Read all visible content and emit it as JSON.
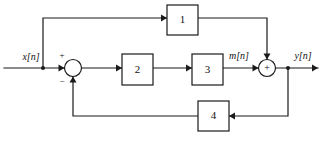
{
  "diagram": {
    "stroke_color": "#1a1a1a",
    "background_color": "#ffffff",
    "blocks": [
      {
        "id": "block-1",
        "label": "1",
        "x": 167,
        "y": 5,
        "w": 31,
        "h": 30
      },
      {
        "id": "block-2",
        "label": "2",
        "x": 122,
        "y": 54,
        "w": 31,
        "h": 31
      },
      {
        "id": "block-3",
        "label": "3",
        "x": 192,
        "y": 54,
        "w": 31,
        "h": 31
      },
      {
        "id": "block-4",
        "label": "4",
        "x": 198,
        "y": 101,
        "w": 31,
        "h": 30
      }
    ],
    "summers": [
      {
        "id": "summer-input",
        "cx": 73,
        "cy": 68,
        "r": 8.5,
        "symbol": ""
      },
      {
        "id": "summer-output",
        "cx": 267,
        "cy": 68,
        "r": 8.5,
        "symbol": "+"
      }
    ],
    "signs": [
      {
        "id": "sign-plus-input",
        "label": "+",
        "x": 62,
        "y": 55
      },
      {
        "id": "sign-minus-input",
        "label": "−",
        "x": 62,
        "y": 82
      }
    ],
    "signals": [
      {
        "id": "signal-x",
        "label": "x[n]",
        "x": 31,
        "y": 58
      },
      {
        "id": "signal-m",
        "label": "m[n]",
        "x": 239,
        "y": 57
      },
      {
        "id": "signal-y",
        "label": "y[n]",
        "x": 303,
        "y": 57
      }
    ],
    "wires": {
      "input_line": "M 4 68 L 64.5 68",
      "feedforward_up": "M 43 68 L 43 18 L 167 18",
      "block1_to_summer": "M 198 18 L 267 18 L 267 59.5",
      "summer_to_block2": "M 81.5 68 L 122 68",
      "block2_to_block3": "M 153 68 L 192 68",
      "block3_to_summer": "M 223 68 L 258.5 68",
      "summer_to_output": "M 275.5 68 L 318 68",
      "feedback_down": "M 288 68 L 288 116 L 229 116",
      "block4_to_summer": "M 198 116 L 73 116 L 73 76.5"
    },
    "arrowheads": [
      {
        "id": "arrow-into-input-summer",
        "x": 64.5,
        "y": 68,
        "dir": "right"
      },
      {
        "id": "arrow-into-block1",
        "x": 167,
        "y": 18,
        "dir": "right"
      },
      {
        "id": "arrow-into-output-summer-top",
        "x": 267,
        "y": 59.5,
        "dir": "down"
      },
      {
        "id": "arrow-into-block2",
        "x": 122,
        "y": 68,
        "dir": "right"
      },
      {
        "id": "arrow-into-block3",
        "x": 192,
        "y": 68,
        "dir": "right"
      },
      {
        "id": "arrow-into-output-summer",
        "x": 258.5,
        "y": 68,
        "dir": "right"
      },
      {
        "id": "arrow-output",
        "x": 318,
        "y": 68,
        "dir": "right"
      },
      {
        "id": "arrow-into-block4",
        "x": 229,
        "y": 116,
        "dir": "left"
      },
      {
        "id": "arrow-into-input-summer-bottom",
        "x": 73,
        "y": 76.5,
        "dir": "up"
      }
    ],
    "junction_dots": [
      {
        "id": "junction-input-branch",
        "x": 43,
        "y": 68
      },
      {
        "id": "junction-output-branch",
        "x": 288,
        "y": 68
      }
    ]
  }
}
